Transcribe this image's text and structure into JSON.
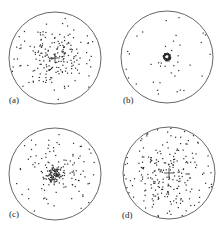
{
  "chart_data": [
    {
      "type": "scatter",
      "panel": "(a)",
      "title": "",
      "xlabel": "",
      "ylabel": "",
      "grid": false,
      "legend": null,
      "boundary": "unit circle",
      "description": "Moderately concentrated cluster of points around the center with a small cross at the center; sparse points out to the boundary",
      "center_px": [
        55,
        58
      ],
      "radius_px": 46,
      "clusters": [
        {
          "count": 170,
          "spread": 0.33
        },
        {
          "count": 30,
          "spread": 1.0,
          "uniform": true
        }
      ],
      "center_marker": "cross",
      "seed": 11
    },
    {
      "type": "scatter",
      "panel": "(b)",
      "title": "",
      "xlabel": "",
      "ylabel": "",
      "grid": false,
      "legend": null,
      "boundary": "unit circle",
      "description": "Very tight ring-shaped cluster at the center; few scattered points near the boundary",
      "center_px": [
        167,
        57
      ],
      "radius_px": 46,
      "clusters": [
        {
          "count": 90,
          "spread": 0.07,
          "ring": true
        },
        {
          "count": 40,
          "spread": 1.0,
          "uniform": true
        }
      ],
      "center_marker": "none",
      "seed": 23
    },
    {
      "type": "scatter",
      "panel": "(c)",
      "title": "",
      "xlabel": "",
      "ylabel": "",
      "grid": false,
      "legend": null,
      "boundary": "unit circle",
      "description": "Dense central cluster with heavy-tailed scatter radiating toward the boundary",
      "center_px": [
        55,
        174
      ],
      "radius_px": 46,
      "clusters": [
        {
          "count": 90,
          "spread": 0.08
        },
        {
          "count": 80,
          "spread": 0.35
        },
        {
          "count": 35,
          "spread": 1.0,
          "uniform": true
        }
      ],
      "center_marker": "none",
      "seed": 37
    },
    {
      "type": "scatter",
      "panel": "(d)",
      "title": "",
      "xlabel": "",
      "ylabel": "",
      "grid": false,
      "legend": null,
      "boundary": "unit circle",
      "description": "Broad diffuse scatter filling most of the disc, with a small cross at the center",
      "center_px": [
        169,
        173
      ],
      "radius_px": 46,
      "clusters": [
        {
          "count": 160,
          "spread": 0.45
        },
        {
          "count": 70,
          "spread": 1.0,
          "uniform": true
        }
      ],
      "center_marker": "cross",
      "seed": 53
    }
  ],
  "labels": {
    "a": "(a)",
    "b": "(b)",
    "c": "(c)",
    "d": "(d)"
  },
  "colors": {
    "points": "#2a2a2a",
    "circle": "#555555",
    "background": "#ffffff"
  }
}
